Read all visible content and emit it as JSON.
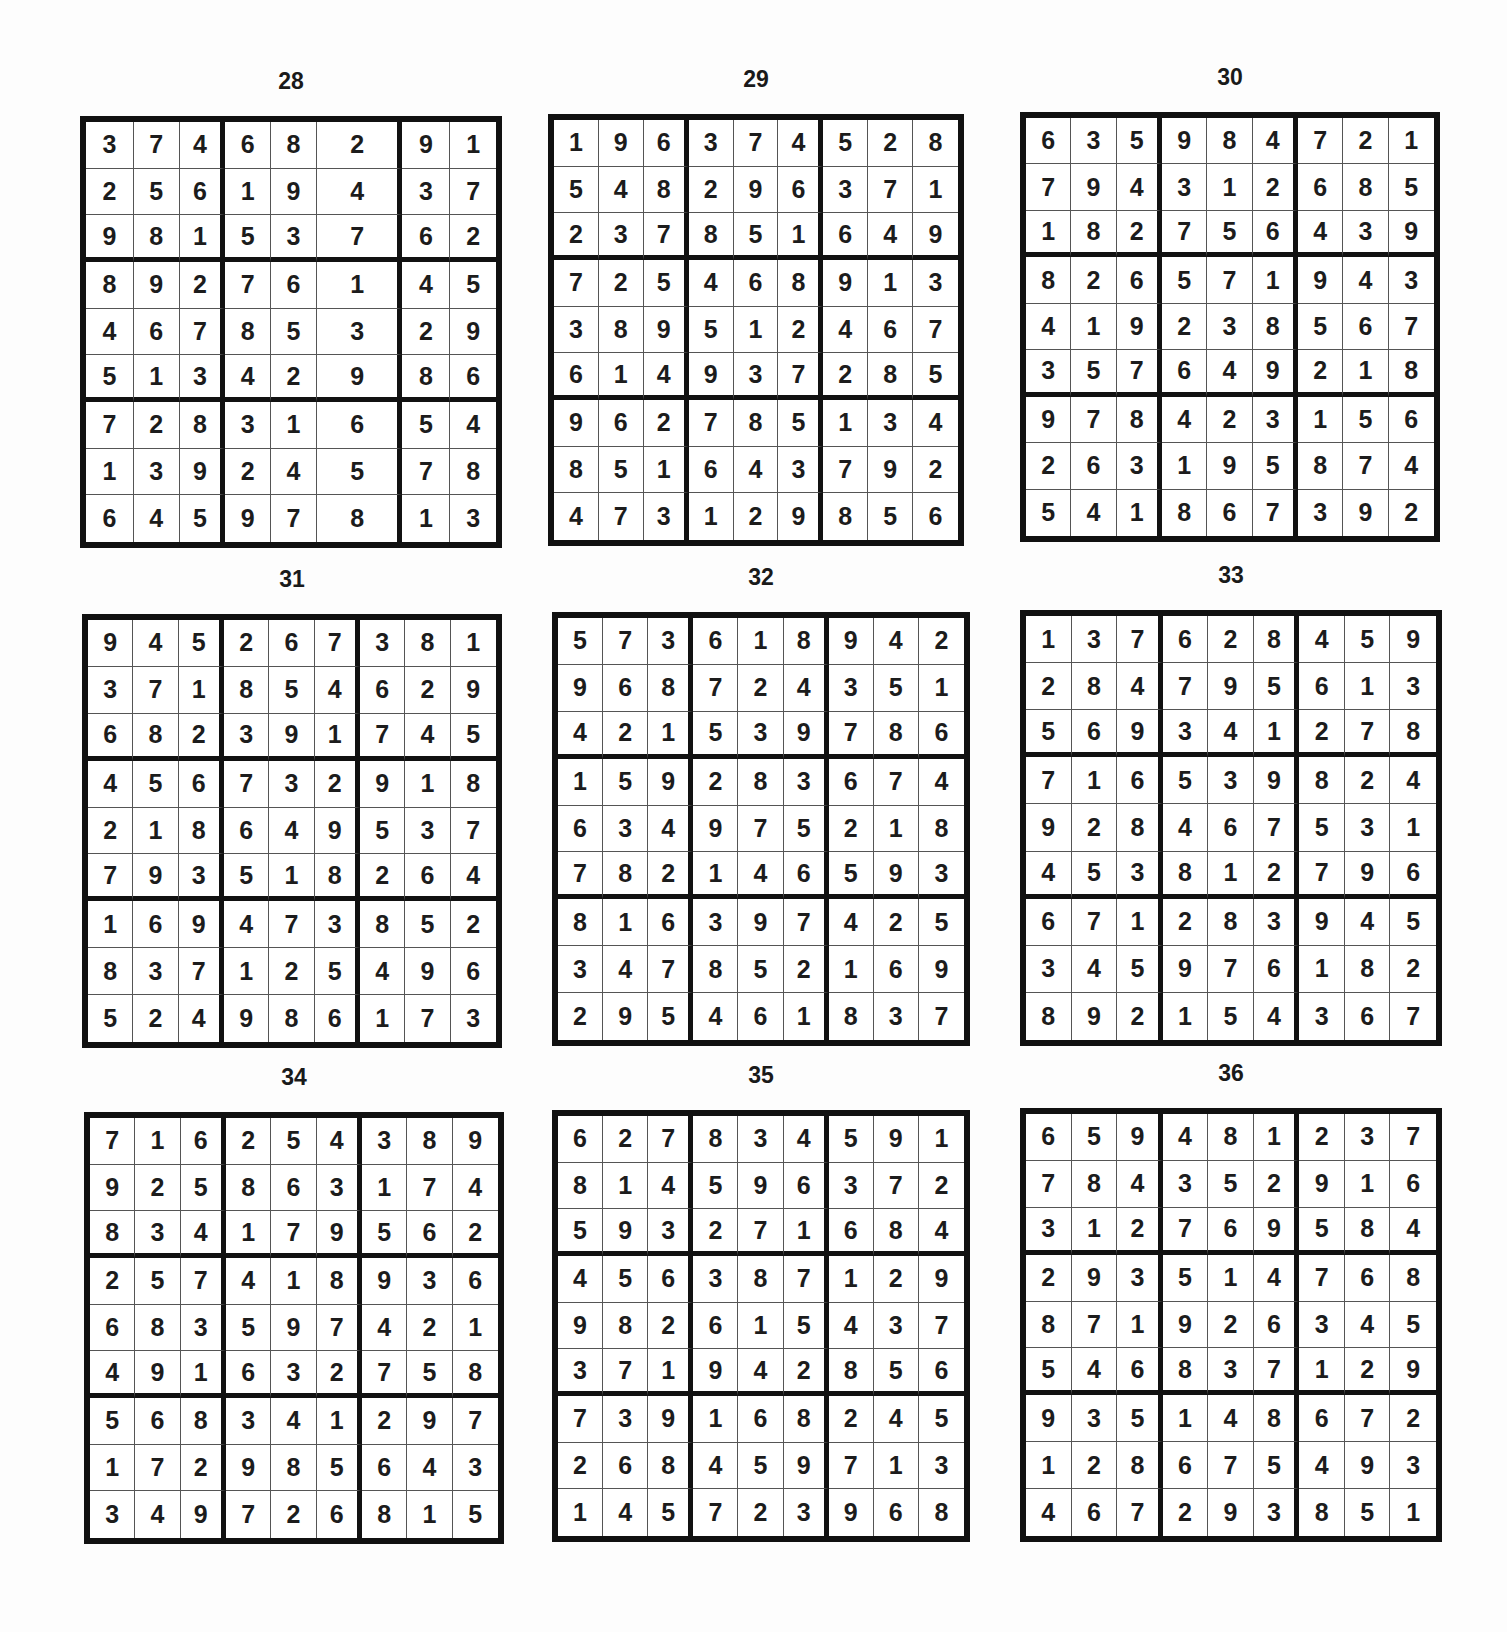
{
  "puzzles": [
    {
      "number": "28",
      "x": 80,
      "y": 68,
      "w": 422,
      "h": 432,
      "gridTop": 48,
      "colWidths": [
        48,
        46,
        46,
        46,
        46,
        86,
        48,
        46
      ],
      "boxAfter": [
        2,
        5
      ],
      "rows": [
        [
          "3",
          "7",
          "4",
          "6",
          "8",
          "2",
          "9",
          "1"
        ],
        [
          "2",
          "5",
          "6",
          "1",
          "9",
          "4",
          "3",
          "7"
        ],
        [
          "9",
          "8",
          "1",
          "5",
          "3",
          "7",
          "6",
          "2"
        ],
        [
          "8",
          "9",
          "2",
          "7",
          "6",
          "1",
          "4",
          "5"
        ],
        [
          "4",
          "6",
          "7",
          "8",
          "5",
          "3",
          "2",
          "9"
        ],
        [
          "5",
          "1",
          "3",
          "4",
          "2",
          "9",
          "8",
          "6"
        ],
        [
          "7",
          "2",
          "8",
          "3",
          "1",
          "6",
          "5",
          "4"
        ],
        [
          "1",
          "3",
          "9",
          "2",
          "4",
          "5",
          "7",
          "8"
        ],
        [
          "6",
          "4",
          "5",
          "9",
          "7",
          "8",
          "1",
          "3"
        ]
      ]
    },
    {
      "number": "29",
      "x": 548,
      "y": 66,
      "w": 416,
      "h": 432,
      "gridTop": 48,
      "rows": [
        [
          "1",
          "9",
          "6",
          "3",
          "7",
          "4",
          "5",
          "2",
          "8"
        ],
        [
          "5",
          "4",
          "8",
          "2",
          "9",
          "6",
          "3",
          "7",
          "1"
        ],
        [
          "2",
          "3",
          "7",
          "8",
          "5",
          "1",
          "6",
          "4",
          "9"
        ],
        [
          "7",
          "2",
          "5",
          "4",
          "6",
          "8",
          "9",
          "1",
          "3"
        ],
        [
          "3",
          "8",
          "9",
          "5",
          "1",
          "2",
          "4",
          "6",
          "7"
        ],
        [
          "6",
          "1",
          "4",
          "9",
          "3",
          "7",
          "2",
          "8",
          "5"
        ],
        [
          "9",
          "6",
          "2",
          "7",
          "8",
          "5",
          "1",
          "3",
          "4"
        ],
        [
          "8",
          "5",
          "1",
          "6",
          "4",
          "3",
          "7",
          "9",
          "2"
        ],
        [
          "4",
          "7",
          "3",
          "1",
          "2",
          "9",
          "8",
          "5",
          "6"
        ]
      ]
    },
    {
      "number": "30",
      "x": 1020,
      "y": 64,
      "w": 420,
      "h": 430,
      "gridTop": 48,
      "rows": [
        [
          "6",
          "3",
          "5",
          "9",
          "8",
          "4",
          "7",
          "2",
          "1"
        ],
        [
          "7",
          "9",
          "4",
          "3",
          "1",
          "2",
          "6",
          "8",
          "5"
        ],
        [
          "1",
          "8",
          "2",
          "7",
          "5",
          "6",
          "4",
          "3",
          "9"
        ],
        [
          "8",
          "2",
          "6",
          "5",
          "7",
          "1",
          "9",
          "4",
          "3"
        ],
        [
          "4",
          "1",
          "9",
          "2",
          "3",
          "8",
          "5",
          "6",
          "7"
        ],
        [
          "3",
          "5",
          "7",
          "6",
          "4",
          "9",
          "2",
          "1",
          "8"
        ],
        [
          "9",
          "7",
          "8",
          "4",
          "2",
          "3",
          "1",
          "5",
          "6"
        ],
        [
          "2",
          "6",
          "3",
          "1",
          "9",
          "5",
          "8",
          "7",
          "4"
        ],
        [
          "5",
          "4",
          "1",
          "8",
          "6",
          "7",
          "3",
          "9",
          "2"
        ]
      ]
    },
    {
      "number": "31",
      "x": 82,
      "y": 566,
      "w": 420,
      "h": 434,
      "gridTop": 48,
      "rows": [
        [
          "9",
          "4",
          "5",
          "2",
          "6",
          "7",
          "3",
          "8",
          "1"
        ],
        [
          "3",
          "7",
          "1",
          "8",
          "5",
          "4",
          "6",
          "2",
          "9"
        ],
        [
          "6",
          "8",
          "2",
          "3",
          "9",
          "1",
          "7",
          "4",
          "5"
        ],
        [
          "4",
          "5",
          "6",
          "7",
          "3",
          "2",
          "9",
          "1",
          "8"
        ],
        [
          "2",
          "1",
          "8",
          "6",
          "4",
          "9",
          "5",
          "3",
          "7"
        ],
        [
          "7",
          "9",
          "3",
          "5",
          "1",
          "8",
          "2",
          "6",
          "4"
        ],
        [
          "1",
          "6",
          "9",
          "4",
          "7",
          "3",
          "8",
          "5",
          "2"
        ],
        [
          "8",
          "3",
          "7",
          "1",
          "2",
          "5",
          "4",
          "9",
          "6"
        ],
        [
          "5",
          "2",
          "4",
          "9",
          "8",
          "6",
          "1",
          "7",
          "3"
        ]
      ]
    },
    {
      "number": "32",
      "x": 552,
      "y": 564,
      "w": 418,
      "h": 434,
      "gridTop": 48,
      "rows": [
        [
          "5",
          "7",
          "3",
          "6",
          "1",
          "8",
          "9",
          "4",
          "2"
        ],
        [
          "9",
          "6",
          "8",
          "7",
          "2",
          "4",
          "3",
          "5",
          "1"
        ],
        [
          "4",
          "2",
          "1",
          "5",
          "3",
          "9",
          "7",
          "8",
          "6"
        ],
        [
          "1",
          "5",
          "9",
          "2",
          "8",
          "3",
          "6",
          "7",
          "4"
        ],
        [
          "6",
          "3",
          "4",
          "9",
          "7",
          "5",
          "2",
          "1",
          "8"
        ],
        [
          "7",
          "8",
          "2",
          "1",
          "4",
          "6",
          "5",
          "9",
          "3"
        ],
        [
          "8",
          "1",
          "6",
          "3",
          "9",
          "7",
          "4",
          "2",
          "5"
        ],
        [
          "3",
          "4",
          "7",
          "8",
          "5",
          "2",
          "1",
          "6",
          "9"
        ],
        [
          "2",
          "9",
          "5",
          "4",
          "6",
          "1",
          "8",
          "3",
          "7"
        ]
      ]
    },
    {
      "number": "33",
      "x": 1020,
      "y": 562,
      "w": 422,
      "h": 436,
      "gridTop": 48,
      "rows": [
        [
          "1",
          "3",
          "7",
          "6",
          "2",
          "8",
          "4",
          "5",
          "9"
        ],
        [
          "2",
          "8",
          "4",
          "7",
          "9",
          "5",
          "6",
          "1",
          "3"
        ],
        [
          "5",
          "6",
          "9",
          "3",
          "4",
          "1",
          "2",
          "7",
          "8"
        ],
        [
          "7",
          "1",
          "6",
          "5",
          "3",
          "9",
          "8",
          "2",
          "4"
        ],
        [
          "9",
          "2",
          "8",
          "4",
          "6",
          "7",
          "5",
          "3",
          "1"
        ],
        [
          "4",
          "5",
          "3",
          "8",
          "1",
          "2",
          "7",
          "9",
          "6"
        ],
        [
          "6",
          "7",
          "1",
          "2",
          "8",
          "3",
          "9",
          "4",
          "5"
        ],
        [
          "3",
          "4",
          "5",
          "9",
          "7",
          "6",
          "1",
          "8",
          "2"
        ],
        [
          "8",
          "9",
          "2",
          "1",
          "5",
          "4",
          "3",
          "6",
          "7"
        ]
      ]
    },
    {
      "number": "34",
      "x": 84,
      "y": 1064,
      "w": 420,
      "h": 432,
      "gridTop": 48,
      "rows": [
        [
          "7",
          "1",
          "6",
          "2",
          "5",
          "4",
          "3",
          "8",
          "9"
        ],
        [
          "9",
          "2",
          "5",
          "8",
          "6",
          "3",
          "1",
          "7",
          "4"
        ],
        [
          "8",
          "3",
          "4",
          "1",
          "7",
          "9",
          "5",
          "6",
          "2"
        ],
        [
          "2",
          "5",
          "7",
          "4",
          "1",
          "8",
          "9",
          "3",
          "6"
        ],
        [
          "6",
          "8",
          "3",
          "5",
          "9",
          "7",
          "4",
          "2",
          "1"
        ],
        [
          "4",
          "9",
          "1",
          "6",
          "3",
          "2",
          "7",
          "5",
          "8"
        ],
        [
          "5",
          "6",
          "8",
          "3",
          "4",
          "1",
          "2",
          "9",
          "7"
        ],
        [
          "1",
          "7",
          "2",
          "9",
          "8",
          "5",
          "6",
          "4",
          "3"
        ],
        [
          "3",
          "4",
          "9",
          "7",
          "2",
          "6",
          "8",
          "1",
          "5"
        ]
      ]
    },
    {
      "number": "35",
      "x": 552,
      "y": 1062,
      "w": 418,
      "h": 432,
      "gridTop": 48,
      "rows": [
        [
          "6",
          "2",
          "7",
          "8",
          "3",
          "4",
          "5",
          "9",
          "1"
        ],
        [
          "8",
          "1",
          "4",
          "5",
          "9",
          "6",
          "3",
          "7",
          "2"
        ],
        [
          "5",
          "9",
          "3",
          "2",
          "7",
          "1",
          "6",
          "8",
          "4"
        ],
        [
          "4",
          "5",
          "6",
          "3",
          "8",
          "7",
          "1",
          "2",
          "9"
        ],
        [
          "9",
          "8",
          "2",
          "6",
          "1",
          "5",
          "4",
          "3",
          "7"
        ],
        [
          "3",
          "7",
          "1",
          "9",
          "4",
          "2",
          "8",
          "5",
          "6"
        ],
        [
          "7",
          "3",
          "9",
          "1",
          "6",
          "8",
          "2",
          "4",
          "5"
        ],
        [
          "2",
          "6",
          "8",
          "4",
          "5",
          "9",
          "7",
          "1",
          "3"
        ],
        [
          "1",
          "4",
          "5",
          "7",
          "2",
          "3",
          "9",
          "6",
          "8"
        ]
      ]
    },
    {
      "number": "36",
      "x": 1020,
      "y": 1060,
      "w": 422,
      "h": 434,
      "gridTop": 48,
      "rows": [
        [
          "6",
          "5",
          "9",
          "4",
          "8",
          "1",
          "2",
          "3",
          "7"
        ],
        [
          "7",
          "8",
          "4",
          "3",
          "5",
          "2",
          "9",
          "1",
          "6"
        ],
        [
          "3",
          "1",
          "2",
          "7",
          "6",
          "9",
          "5",
          "8",
          "4"
        ],
        [
          "2",
          "9",
          "3",
          "5",
          "1",
          "4",
          "7",
          "6",
          "8"
        ],
        [
          "8",
          "7",
          "1",
          "9",
          "2",
          "6",
          "3",
          "4",
          "5"
        ],
        [
          "5",
          "4",
          "6",
          "8",
          "3",
          "7",
          "1",
          "2",
          "9"
        ],
        [
          "9",
          "3",
          "5",
          "1",
          "4",
          "8",
          "6",
          "7",
          "2"
        ],
        [
          "1",
          "2",
          "8",
          "6",
          "7",
          "5",
          "4",
          "9",
          "3"
        ],
        [
          "4",
          "6",
          "7",
          "2",
          "9",
          "3",
          "8",
          "5",
          "1"
        ]
      ]
    }
  ]
}
